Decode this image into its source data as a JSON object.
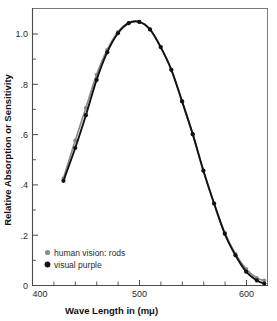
{
  "chart_data": {
    "type": "line",
    "title": "",
    "xlabel": "Wave Length in (mμ)",
    "ylabel": "Relative Absorption or Sensitivity",
    "xlim": [
      400,
      620
    ],
    "ylim": [
      0,
      1.1
    ],
    "xticks": [
      400,
      500,
      600
    ],
    "xticklabels": [
      "400",
      "500",
      "600"
    ],
    "xtick_minor_step": 20,
    "yticks": [
      0,
      0.2,
      0.4,
      0.6,
      0.8,
      1.0
    ],
    "yticklabels": [
      "0",
      ".2",
      ".4",
      ".6",
      ".8",
      "1.0"
    ],
    "ytick_minor_step": 0.1,
    "grid": false,
    "legend_position": "lower-left",
    "series": [
      {
        "name": "human vision: rods",
        "color": "#8a8a8a",
        "marker": "circle",
        "x": [
          429,
          440,
          450,
          460,
          470,
          480,
          490,
          500,
          510,
          520,
          530,
          540,
          550,
          560,
          570,
          580,
          590,
          600,
          610,
          617
        ],
        "y": [
          0.425,
          0.575,
          0.705,
          0.835,
          0.935,
          1.005,
          1.04,
          1.045,
          1.015,
          0.945,
          0.855,
          0.73,
          0.6,
          0.455,
          0.325,
          0.21,
          0.125,
          0.065,
          0.03,
          0.02
        ]
      },
      {
        "name": "visual purple",
        "color": "#121212",
        "marker": "circle",
        "x": [
          429,
          440,
          450,
          460,
          470,
          480,
          490,
          500,
          510,
          520,
          530,
          540,
          550,
          560,
          570,
          580,
          590,
          600,
          610,
          617
        ],
        "y": [
          0.415,
          0.545,
          0.675,
          0.815,
          0.925,
          1.0,
          1.04,
          1.045,
          1.015,
          0.945,
          0.855,
          0.73,
          0.6,
          0.455,
          0.325,
          0.205,
          0.12,
          0.055,
          0.02,
          0.008
        ]
      }
    ],
    "legend": [
      {
        "label": "human vision: rods",
        "color": "#8a8a8a"
      },
      {
        "label": "visual purple",
        "color": "#121212"
      }
    ]
  }
}
